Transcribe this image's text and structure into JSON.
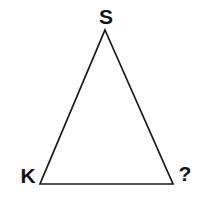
{
  "figure": {
    "kind": "geometry-diagram",
    "shape": "triangle",
    "background_color": "#ffffff",
    "stroke_color": "#1a1a1a",
    "stroke_width": 1.7,
    "fill": "none",
    "width": 197,
    "height": 200,
    "vertices": [
      {
        "name": "apex",
        "label": "S",
        "x": 105,
        "y": 30
      },
      {
        "name": "bottom-left",
        "label": "K",
        "x": 40,
        "y": 184
      },
      {
        "name": "bottom-right",
        "label": "?",
        "x": 173,
        "y": 184
      }
    ],
    "polygon_points": "105,30 173,184 40,184",
    "labels": {
      "apex": "S",
      "bottom_left": "K",
      "bottom_right": "?"
    },
    "label_color": "#141414"
  }
}
